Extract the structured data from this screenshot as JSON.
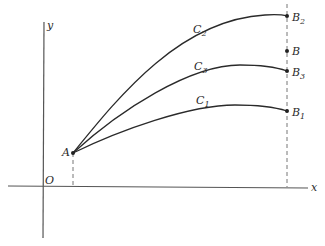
{
  "diagram": {
    "axes": {
      "x_label": "x",
      "y_label": "y",
      "origin_label": "O"
    },
    "start_point": {
      "label": "A"
    },
    "curves": [
      {
        "id": "C2",
        "label": "C",
        "sub": "2",
        "end_label": "B",
        "end_sub": "2"
      },
      {
        "id": "C3",
        "label": "C",
        "sub": "3",
        "end_label": "B",
        "end_sub": "3"
      },
      {
        "id": "C1",
        "label": "C",
        "sub": "1",
        "end_label": "B",
        "end_sub": "1"
      }
    ],
    "target_point": {
      "label": "B"
    },
    "colors": {
      "line": "#2a2a2a",
      "axis": "#555555",
      "dash": "#777777"
    }
  }
}
